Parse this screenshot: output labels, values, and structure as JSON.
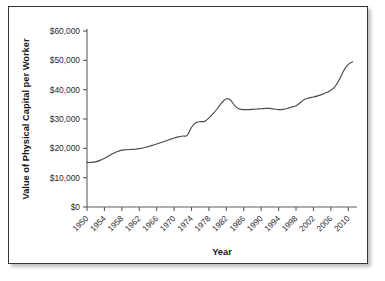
{
  "chart_data": {
    "type": "line",
    "title": "",
    "xlabel": "Year",
    "ylabel": "Value of Physical Capital per Worker",
    "xlim": [
      1950,
      2012
    ],
    "ylim": [
      0,
      60000
    ],
    "grid": false,
    "legend": null,
    "y_ticks": [
      0,
      10000,
      20000,
      30000,
      40000,
      50000,
      60000
    ],
    "y_tick_labels": [
      "$0",
      "$10,000",
      "$20,000",
      "$30,000",
      "$40,000",
      "$50,000",
      "$60,000"
    ],
    "x_ticks": [
      1950,
      1954,
      1958,
      1962,
      1966,
      1970,
      1974,
      1978,
      1982,
      1986,
      1990,
      1994,
      1998,
      2002,
      2006,
      2010
    ],
    "x_tick_labels": [
      "1950",
      "1954",
      "1958",
      "1962",
      "1966",
      "1970",
      "1974",
      "1978",
      "1982",
      "1986",
      "1990",
      "1994",
      "1998",
      "2002",
      "2006",
      "2010"
    ],
    "x_tick_rotation": -45,
    "series": [
      {
        "name": "Value of Physical Capital per Worker",
        "color": "#4a4a4e",
        "x": [
          1950,
          1951,
          1952,
          1953,
          1954,
          1955,
          1956,
          1957,
          1958,
          1959,
          1960,
          1961,
          1962,
          1963,
          1964,
          1965,
          1966,
          1967,
          1968,
          1969,
          1970,
          1971,
          1972,
          1973,
          1974,
          1975,
          1976,
          1977,
          1978,
          1979,
          1980,
          1981,
          1982,
          1983,
          1984,
          1985,
          1986,
          1987,
          1988,
          1989,
          1990,
          1991,
          1992,
          1993,
          1994,
          1995,
          1996,
          1997,
          1998,
          1999,
          2000,
          2001,
          2002,
          2003,
          2004,
          2005,
          2006,
          2007,
          2008,
          2009,
          2010,
          2011
        ],
        "y": [
          15200,
          15200,
          15400,
          15900,
          16600,
          17400,
          18200,
          18900,
          19400,
          19500,
          19600,
          19700,
          19900,
          20200,
          20600,
          21000,
          21500,
          22000,
          22500,
          23000,
          23500,
          23900,
          24200,
          24400,
          27200,
          28700,
          29100,
          29200,
          30300,
          31900,
          33700,
          35600,
          36900,
          36400,
          34400,
          33400,
          33200,
          33200,
          33300,
          33400,
          33500,
          33600,
          33600,
          33400,
          33200,
          33300,
          33600,
          34100,
          34500,
          35600,
          36700,
          37200,
          37500,
          37900,
          38400,
          39000,
          39800,
          41100,
          43600,
          46600,
          48600,
          49500
        ]
      }
    ]
  }
}
